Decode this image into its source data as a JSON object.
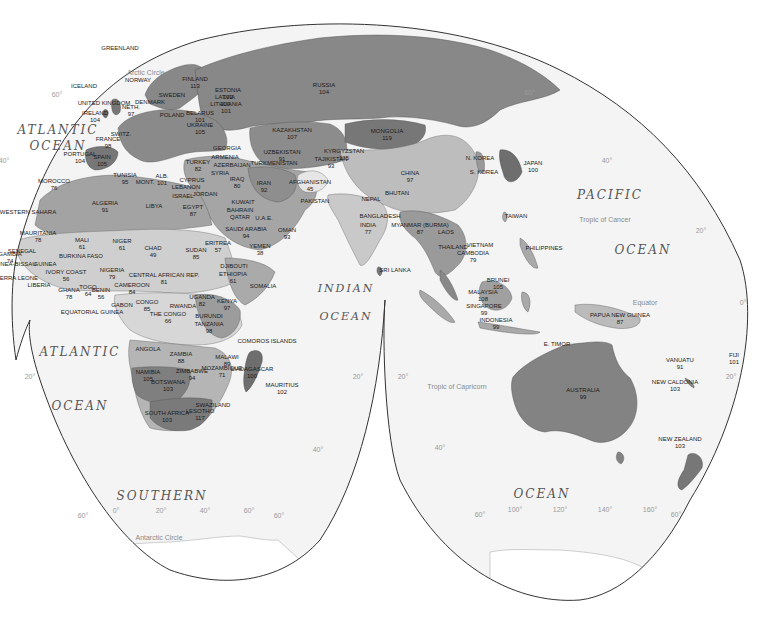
{
  "map": {
    "projection": "interrupted-goode-homolosine",
    "colors": {
      "ocean": "#f4f4f4",
      "background": "#ffffff",
      "outline": "#333333",
      "shade_darkest": "#6e6e6e",
      "shade_dark": "#888888",
      "shade_mid": "#a9a9a9",
      "shade_light": "#c6c6c6",
      "shade_lightest": "#e2e2e2",
      "label": "#1a1a1a",
      "graticule_label": "#9a9a9a"
    },
    "oceans": [
      {
        "id": "atlantic-north-1",
        "text": "ATLANTIC",
        "x": 58,
        "y": 130,
        "size": 12
      },
      {
        "id": "atlantic-north-2",
        "text": "OCEAN",
        "x": 58,
        "y": 146,
        "size": 12
      },
      {
        "id": "atlantic-south-1",
        "text": "ATLANTIC",
        "x": 80,
        "y": 352,
        "size": 12
      },
      {
        "id": "atlantic-south-2",
        "text": "OCEAN",
        "x": 80,
        "y": 406,
        "size": 12
      },
      {
        "id": "indian-1",
        "text": "INDIAN",
        "x": 346,
        "y": 288,
        "size": 11
      },
      {
        "id": "indian-2",
        "text": "OCEAN",
        "x": 346,
        "y": 316,
        "size": 11
      },
      {
        "id": "pacific-1",
        "text": "PACIFIC",
        "x": 610,
        "y": 195,
        "size": 12
      },
      {
        "id": "pacific-2",
        "text": "OCEAN",
        "x": 643,
        "y": 250,
        "size": 12
      },
      {
        "id": "southern-1",
        "text": "SOUTHERN",
        "x": 162,
        "y": 496,
        "size": 12
      },
      {
        "id": "southern-2",
        "text": "OCEAN",
        "x": 542,
        "y": 494,
        "size": 12
      }
    ],
    "reference_lines": [
      {
        "id": "arctic-circle",
        "text": "Arctic Circle",
        "x": 146,
        "y": 72
      },
      {
        "id": "tropic-cancer",
        "text": "Tropic of Cancer",
        "x": 605,
        "y": 219
      },
      {
        "id": "equator",
        "text": "Equator",
        "x": 645,
        "y": 302
      },
      {
        "id": "tropic-capricorn",
        "text": "Tropic of Capricorn",
        "x": 457,
        "y": 386
      },
      {
        "id": "antarctic-circle",
        "text": "Antarctic Circle",
        "x": 159,
        "y": 537
      }
    ],
    "graticule_labels": [
      {
        "text": "60°",
        "x": 57,
        "y": 94
      },
      {
        "text": "40°",
        "x": 4,
        "y": 160
      },
      {
        "text": "60°",
        "x": 530,
        "y": 92
      },
      {
        "text": "40°",
        "x": 607,
        "y": 160
      },
      {
        "text": "20°",
        "x": 701,
        "y": 230
      },
      {
        "text": "0°",
        "x": 743,
        "y": 302
      },
      {
        "text": "20°",
        "x": 731,
        "y": 376
      },
      {
        "text": "20°",
        "x": 30,
        "y": 376
      },
      {
        "text": "20°",
        "x": 358,
        "y": 376
      },
      {
        "text": "20°",
        "x": 403,
        "y": 376
      },
      {
        "text": "40°",
        "x": 318,
        "y": 449
      },
      {
        "text": "40°",
        "x": 440,
        "y": 447
      },
      {
        "text": "60°",
        "x": 83,
        "y": 515
      },
      {
        "text": "0°",
        "x": 116,
        "y": 510
      },
      {
        "text": "20°",
        "x": 161,
        "y": 510
      },
      {
        "text": "40°",
        "x": 205,
        "y": 510
      },
      {
        "text": "60°",
        "x": 249,
        "y": 510
      },
      {
        "text": "60°",
        "x": 279,
        "y": 515
      },
      {
        "text": "60°",
        "x": 480,
        "y": 514
      },
      {
        "text": "100°",
        "x": 515,
        "y": 509
      },
      {
        "text": "120°",
        "x": 560,
        "y": 509
      },
      {
        "text": "140°",
        "x": 605,
        "y": 509
      },
      {
        "text": "160°",
        "x": 650,
        "y": 509
      },
      {
        "text": "60°",
        "x": 676,
        "y": 514
      }
    ],
    "countries": [
      {
        "name": "GREENLAND",
        "value": "",
        "x": 120,
        "y": 48
      },
      {
        "name": "ICELAND",
        "value": "",
        "x": 84,
        "y": 86
      },
      {
        "name": "NORWAY",
        "value": "",
        "x": 138,
        "y": 80
      },
      {
        "name": "FINLAND",
        "value": "113",
        "x": 195,
        "y": 82
      },
      {
        "name": "SWEDEN",
        "value": "",
        "x": 172,
        "y": 95
      },
      {
        "name": "ESTONIA",
        "value": "102",
        "x": 228,
        "y": 93
      },
      {
        "name": "LATVIA",
        "value": "100",
        "x": 225,
        "y": 100
      },
      {
        "name": "LITHUANIA",
        "value": "101",
        "x": 226,
        "y": 107
      },
      {
        "name": "UNITED KINGDOM",
        "value": "",
        "x": 104,
        "y": 103
      },
      {
        "name": "DENMARK",
        "value": "",
        "x": 150,
        "y": 102
      },
      {
        "name": "NETH.",
        "value": "97",
        "x": 131,
        "y": 110
      },
      {
        "name": "IRELAND",
        "value": "104",
        "x": 95,
        "y": 116
      },
      {
        "name": "POLAND",
        "value": "",
        "x": 172,
        "y": 115
      },
      {
        "name": "BELARUS",
        "value": "101",
        "x": 200,
        "y": 116
      },
      {
        "name": "UKRAINE",
        "value": "105",
        "x": 200,
        "y": 128
      },
      {
        "name": "SWITZ.",
        "value": "",
        "x": 121,
        "y": 134
      },
      {
        "name": "FRANCE",
        "value": "98",
        "x": 108,
        "y": 142
      },
      {
        "name": "GEORGIA",
        "value": "",
        "x": 227,
        "y": 148
      },
      {
        "name": "RUSSIA",
        "value": "104",
        "x": 324,
        "y": 88
      },
      {
        "name": "KAZAKHSTAN",
        "value": "107",
        "x": 292,
        "y": 133
      },
      {
        "name": "MONGOLIA",
        "value": "119",
        "x": 387,
        "y": 134
      },
      {
        "name": "UZBEKISTAN",
        "value": "91",
        "x": 282,
        "y": 155
      },
      {
        "name": "TURKMENISTAN",
        "value": "",
        "x": 274,
        "y": 163
      },
      {
        "name": "KYRGYZSTAN",
        "value": "105",
        "x": 344,
        "y": 154
      },
      {
        "name": "TAJIKISTAN",
        "value": "93",
        "x": 331,
        "y": 162
      },
      {
        "name": "PORTUGAL",
        "value": "104",
        "x": 80,
        "y": 157
      },
      {
        "name": "SPAIN",
        "value": "105",
        "x": 102,
        "y": 160
      },
      {
        "name": "TURKEY",
        "value": "82",
        "x": 198,
        "y": 165
      },
      {
        "name": "ARMENIA",
        "value": "",
        "x": 225,
        "y": 157
      },
      {
        "name": "AZERBAIJAN",
        "value": "",
        "x": 232,
        "y": 165
      },
      {
        "name": "SYRIA",
        "value": "",
        "x": 220,
        "y": 173
      },
      {
        "name": "CYPRUS",
        "value": "",
        "x": 192,
        "y": 180
      },
      {
        "name": "LEBANON",
        "value": "",
        "x": 186,
        "y": 187
      },
      {
        "name": "ISRAEL",
        "value": "",
        "x": 183,
        "y": 196
      },
      {
        "name": "JORDAN",
        "value": "",
        "x": 205,
        "y": 194
      },
      {
        "name": "IRAQ",
        "value": "80",
        "x": 237,
        "y": 182
      },
      {
        "name": "IRAN",
        "value": "92",
        "x": 264,
        "y": 186
      },
      {
        "name": "AFGHANISTAN",
        "value": "45",
        "x": 310,
        "y": 185
      },
      {
        "name": "PAKISTAN",
        "value": "",
        "x": 315,
        "y": 201
      },
      {
        "name": "CHINA",
        "value": "97",
        "x": 410,
        "y": 176
      },
      {
        "name": "N. KOREA",
        "value": "",
        "x": 480,
        "y": 158
      },
      {
        "name": "S. KOREA",
        "value": "",
        "x": 484,
        "y": 172
      },
      {
        "name": "JAPAN",
        "value": "100",
        "x": 533,
        "y": 166
      },
      {
        "name": "NEPAL",
        "value": "",
        "x": 371,
        "y": 199
      },
      {
        "name": "BHUTAN",
        "value": "",
        "x": 397,
        "y": 193
      },
      {
        "name": "BANGLADESH",
        "value": "",
        "x": 380,
        "y": 216
      },
      {
        "name": "INDIA",
        "value": "77",
        "x": 368,
        "y": 228
      },
      {
        "name": "MYANMAR (BURMA)",
        "value": "87",
        "x": 420,
        "y": 228
      },
      {
        "name": "LAOS",
        "value": "",
        "x": 446,
        "y": 232
      },
      {
        "name": "THAILAND",
        "value": "",
        "x": 453,
        "y": 247
      },
      {
        "name": "VIETNAM",
        "value": "",
        "x": 480,
        "y": 245
      },
      {
        "name": "CAMBODIA",
        "value": "79",
        "x": 473,
        "y": 256
      },
      {
        "name": "TAIWAN",
        "value": "",
        "x": 516,
        "y": 216
      },
      {
        "name": "PHILIPPINES",
        "value": "",
        "x": 544,
        "y": 248
      },
      {
        "name": "SRI LANKA",
        "value": "",
        "x": 395,
        "y": 270
      },
      {
        "name": "BRUNEI",
        "value": "105",
        "x": 498,
        "y": 283
      },
      {
        "name": "MALAYSIA",
        "value": "108",
        "x": 483,
        "y": 295
      },
      {
        "name": "SINGAPORE",
        "value": "99",
        "x": 484,
        "y": 309
      },
      {
        "name": "INDONESIA",
        "value": "99",
        "x": 496,
        "y": 323
      },
      {
        "name": "E. TIMOR",
        "value": "",
        "x": 557,
        "y": 344
      },
      {
        "name": "PAPUA NEW GUINEA",
        "value": "87",
        "x": 620,
        "y": 318
      },
      {
        "name": "AUSTRALIA",
        "value": "99",
        "x": 583,
        "y": 393
      },
      {
        "name": "VANUATU",
        "value": "91",
        "x": 680,
        "y": 363
      },
      {
        "name": "FIJI",
        "value": "101",
        "x": 734,
        "y": 358
      },
      {
        "name": "NEW CALDONIA",
        "value": "103",
        "x": 675,
        "y": 385
      },
      {
        "name": "NEW ZEALAND",
        "value": "103",
        "x": 680,
        "y": 442
      },
      {
        "name": "MOROCCO",
        "value": "76",
        "x": 54,
        "y": 184
      },
      {
        "name": "TUNISIA",
        "value": "95",
        "x": 125,
        "y": 178
      },
      {
        "name": "MONT.",
        "value": "",
        "x": 145,
        "y": 182
      },
      {
        "name": "ALB.",
        "value": "101",
        "x": 162,
        "y": 179
      },
      {
        "name": "WESTERN SAHARA",
        "value": "",
        "x": 28,
        "y": 212
      },
      {
        "name": "ALGERIA",
        "value": "91",
        "x": 105,
        "y": 206
      },
      {
        "name": "LIBYA",
        "value": "",
        "x": 154,
        "y": 206
      },
      {
        "name": "EGYPT",
        "value": "87",
        "x": 193,
        "y": 210
      },
      {
        "name": "KUWAIT",
        "value": "",
        "x": 243,
        "y": 202
      },
      {
        "name": "BAHRAIN",
        "value": "",
        "x": 240,
        "y": 210
      },
      {
        "name": "QATAR",
        "value": "",
        "x": 240,
        "y": 217
      },
      {
        "name": "U.A.E.",
        "value": "",
        "x": 264,
        "y": 218
      },
      {
        "name": "SAUDI ARABIA",
        "value": "94",
        "x": 246,
        "y": 232
      },
      {
        "name": "OMAN",
        "value": "93",
        "x": 287,
        "y": 233
      },
      {
        "name": "MAURITANIA",
        "value": "78",
        "x": 38,
        "y": 236
      },
      {
        "name": "MALI",
        "value": "61",
        "x": 82,
        "y": 243
      },
      {
        "name": "NIGER",
        "value": "61",
        "x": 122,
        "y": 244
      },
      {
        "name": "CHAD",
        "value": "49",
        "x": 153,
        "y": 251
      },
      {
        "name": "SUDAN",
        "value": "85",
        "x": 196,
        "y": 253
      },
      {
        "name": "ERITREA",
        "value": "57",
        "x": 218,
        "y": 246
      },
      {
        "name": "YEMEN",
        "value": "38",
        "x": 260,
        "y": 249
      },
      {
        "name": "DJIBOUTI",
        "value": "",
        "x": 234,
        "y": 266
      },
      {
        "name": "ETHIOPIA",
        "value": "61",
        "x": 233,
        "y": 277
      },
      {
        "name": "SOMALIA",
        "value": "",
        "x": 263,
        "y": 286
      },
      {
        "name": "SENEGAL",
        "value": "",
        "x": 22,
        "y": 251
      },
      {
        "name": "GAMBIA",
        "value": "74",
        "x": 10,
        "y": 257
      },
      {
        "name": "GUINEA-BISSAU",
        "value": "",
        "x": 13,
        "y": 264
      },
      {
        "name": "GUINEA",
        "value": "",
        "x": 45,
        "y": 264
      },
      {
        "name": "BURKINA FASO",
        "value": "",
        "x": 81,
        "y": 256
      },
      {
        "name": "SIERRA LEONE",
        "value": "",
        "x": 16,
        "y": 278
      },
      {
        "name": "LIBERIA",
        "value": "",
        "x": 39,
        "y": 285
      },
      {
        "name": "IVORY COAST",
        "value": "56",
        "x": 66,
        "y": 275
      },
      {
        "name": "GHANA",
        "value": "78",
        "x": 69,
        "y": 293
      },
      {
        "name": "TOGO",
        "value": "64",
        "x": 88,
        "y": 290
      },
      {
        "name": "BENIN",
        "value": "56",
        "x": 101,
        "y": 293
      },
      {
        "name": "NIGERIA",
        "value": "79",
        "x": 112,
        "y": 273
      },
      {
        "name": "CENTRAL AFRICAN REP.",
        "value": "81",
        "x": 164,
        "y": 278
      },
      {
        "name": "CAMEROON",
        "value": "84",
        "x": 132,
        "y": 288
      },
      {
        "name": "EQUATORIAL GUINEA",
        "value": "",
        "x": 92,
        "y": 312
      },
      {
        "name": "GABON",
        "value": "",
        "x": 122,
        "y": 305
      },
      {
        "name": "CONGO",
        "value": "85",
        "x": 147,
        "y": 305
      },
      {
        "name": "THE CONGO",
        "value": "66",
        "x": 168,
        "y": 317
      },
      {
        "name": "UGANDA",
        "value": "82",
        "x": 202,
        "y": 300
      },
      {
        "name": "KENYA",
        "value": "97",
        "x": 227,
        "y": 304
      },
      {
        "name": "RWANDA",
        "value": "",
        "x": 183,
        "y": 306
      },
      {
        "name": "BURUNDI",
        "value": "",
        "x": 209,
        "y": 316
      },
      {
        "name": "TANZANIA",
        "value": "98",
        "x": 209,
        "y": 327
      },
      {
        "name": "ANGOLA",
        "value": "",
        "x": 148,
        "y": 349
      },
      {
        "name": "ZAMBIA",
        "value": "88",
        "x": 181,
        "y": 357
      },
      {
        "name": "MALAWI",
        "value": "89",
        "x": 227,
        "y": 360
      },
      {
        "name": "COMOROS ISLANDS",
        "value": "",
        "x": 267,
        "y": 341
      },
      {
        "name": "NAMIBIA",
        "value": "105",
        "x": 148,
        "y": 375
      },
      {
        "name": "ZIMBABWE",
        "value": "94",
        "x": 192,
        "y": 374
      },
      {
        "name": "MOZAMBIQUE",
        "value": "71",
        "x": 222,
        "y": 371
      },
      {
        "name": "MADAGASCAR",
        "value": "100",
        "x": 252,
        "y": 372
      },
      {
        "name": "BOTSWANA",
        "value": "103",
        "x": 168,
        "y": 385
      },
      {
        "name": "MAURITIUS",
        "value": "102",
        "x": 282,
        "y": 388
      },
      {
        "name": "SWAZILAND",
        "value": "",
        "x": 213,
        "y": 405
      },
      {
        "name": "LESOTHO",
        "value": "117",
        "x": 200,
        "y": 414
      },
      {
        "name": "SOUTH AFRICA",
        "value": "103",
        "x": 167,
        "y": 416
      }
    ]
  }
}
